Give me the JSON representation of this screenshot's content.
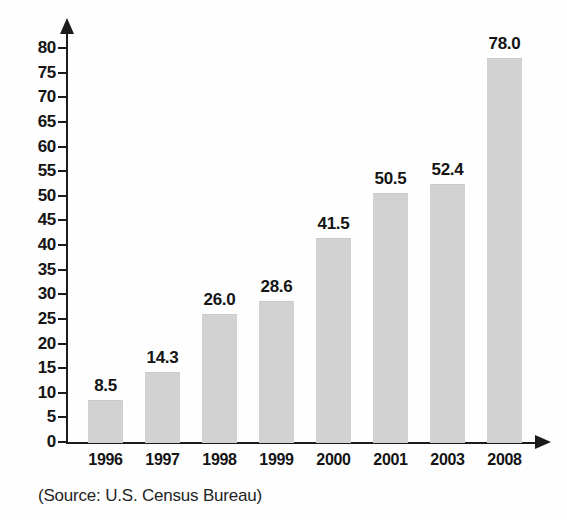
{
  "chart_data": {
    "type": "bar",
    "title": "",
    "subtitle": "",
    "xlabel": "",
    "ylabel": "",
    "categories": [
      "1996",
      "1997",
      "1998",
      "1999",
      "2000",
      "2001",
      "2003",
      "2008"
    ],
    "values": [
      8.5,
      14.3,
      26.0,
      28.6,
      41.5,
      50.5,
      52.4,
      78.0
    ],
    "value_labels": [
      "8.5",
      "14.3",
      "26.0",
      "28.6",
      "41.5",
      "50.5",
      "52.4",
      "78.0"
    ],
    "ylim": [
      0,
      80
    ],
    "ytick_step": 5,
    "ytick_labels": [
      "0",
      "5",
      "10",
      "15",
      "20",
      "25",
      "30",
      "35",
      "40",
      "45",
      "50",
      "55",
      "60",
      "65",
      "70",
      "75",
      "80"
    ],
    "ytick_values": [
      0,
      5,
      10,
      15,
      20,
      25,
      30,
      35,
      40,
      45,
      50,
      55,
      60,
      65,
      70,
      75,
      80
    ],
    "grid": false,
    "legend": null,
    "legend_position": "none",
    "bar_color": "#d2d2d2",
    "axis_color": "#1b1b1b",
    "text_color": "#141414",
    "background": "#fefefe",
    "annotations": {
      "source": "(Source: U.S. Census Bureau)"
    }
  },
  "icons": {
    "y_axis_arrow": "arrow-up-icon",
    "x_axis_arrow": "arrow-right-icon"
  }
}
